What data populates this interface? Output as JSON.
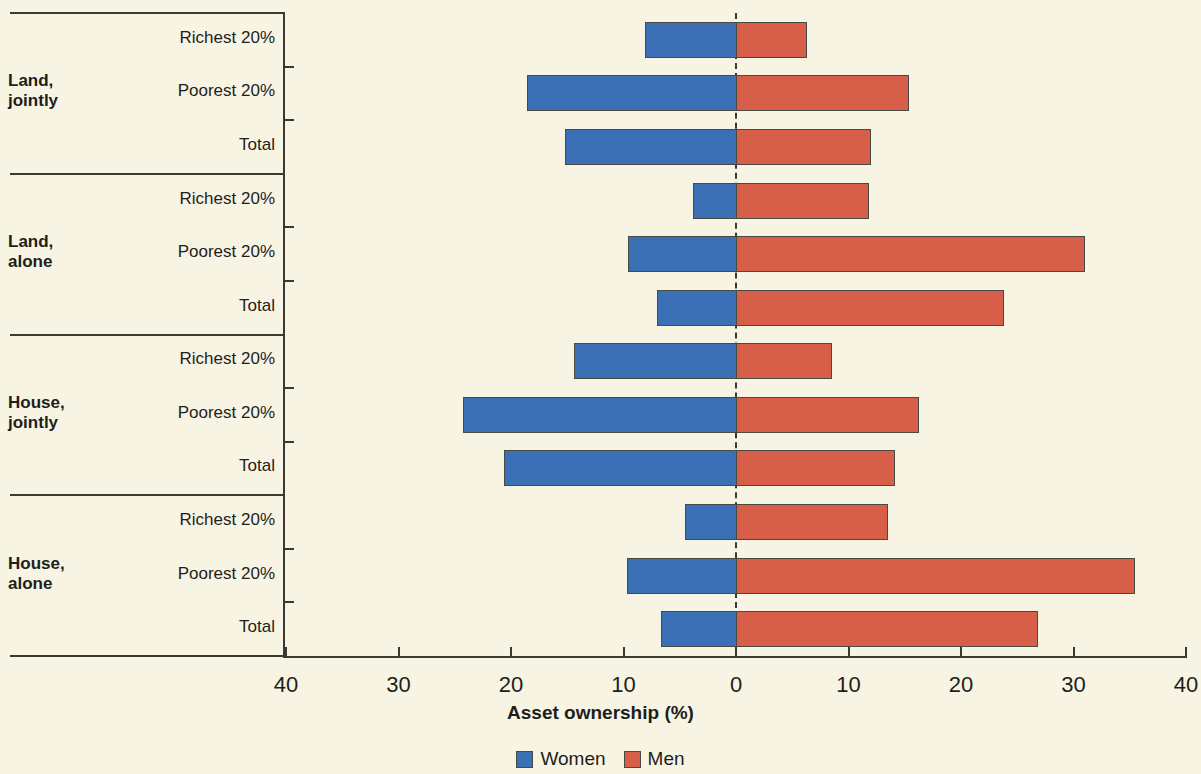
{
  "chart_data": {
    "type": "bar",
    "orientation": "horizontal-diverging",
    "title": "",
    "xlabel": "Asset ownership (%)",
    "ylabel": "",
    "xlim": [
      -40,
      40
    ],
    "xticks": [
      40,
      30,
      20,
      10,
      0,
      10,
      20,
      30,
      40
    ],
    "xtick_labels": [
      "40",
      "30",
      "20",
      "10",
      "0",
      "10",
      "20",
      "30",
      "40"
    ],
    "grid": false,
    "legend_position": "bottom",
    "zero_line": "dashed",
    "colors": {
      "women": "#3c70b6",
      "men": "#d75f49",
      "background": "#f8f4e4",
      "ink": "#3a3a33"
    },
    "series": [
      {
        "name": "Women",
        "direction": "left",
        "color": "#3c70b6",
        "values": [
          8.1,
          18.6,
          15.2,
          3.8,
          9.6,
          7.0,
          14.4,
          24.3,
          20.6,
          4.5,
          9.7,
          6.7
        ]
      },
      {
        "name": "Men",
        "direction": "right",
        "color": "#d75f49",
        "values": [
          6.3,
          15.4,
          12.0,
          11.8,
          31.0,
          23.8,
          8.5,
          16.3,
          14.1,
          13.5,
          35.5,
          26.8
        ]
      }
    ],
    "groups": [
      {
        "label": "Land,\njointly",
        "label_line1": "Land,",
        "label_line2": "jointly",
        "rows": [
          "Richest 20%",
          "Poorest 20%",
          "Total"
        ]
      },
      {
        "label": "Land,\nalone",
        "label_line1": "Land,",
        "label_line2": "alone",
        "rows": [
          "Richest 20%",
          "Poorest 20%",
          "Total"
        ]
      },
      {
        "label": "House,\njointly",
        "label_line1": "House,",
        "label_line2": "jointly",
        "rows": [
          "Richest 20%",
          "Poorest 20%",
          "Total"
        ]
      },
      {
        "label": "House,\nalone",
        "label_line1": "House,",
        "label_line2": "alone",
        "rows": [
          "Richest 20%",
          "Poorest 20%",
          "Total"
        ]
      }
    ],
    "categories": [
      "Land, jointly - Richest 20%",
      "Land, jointly - Poorest 20%",
      "Land, jointly - Total",
      "Land, alone - Richest 20%",
      "Land, alone - Poorest 20%",
      "Land, alone - Total",
      "House, jointly - Richest 20%",
      "House, jointly - Poorest 20%",
      "House, jointly - Total",
      "House, alone - Richest 20%",
      "House, alone - Poorest 20%",
      "House, alone - Total"
    ]
  },
  "legend": {
    "items": [
      {
        "label": "Women",
        "color": "#3c70b6"
      },
      {
        "label": "Men",
        "color": "#d75f49"
      }
    ]
  },
  "axis": {
    "title": "Asset ownership (%)"
  }
}
